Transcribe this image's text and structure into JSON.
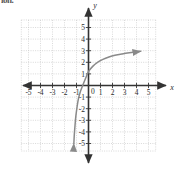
{
  "figure": {
    "corner_fragment": "ion.",
    "x_axis_name": "x",
    "y_axis_name": "y",
    "origin_label": "0"
  },
  "chart_data": {
    "type": "line",
    "title": "",
    "subtitle": "",
    "xlabel": "x",
    "ylabel": "y",
    "xlim": [
      -5.8,
      5.8
    ],
    "ylim": [
      -5.8,
      5.8
    ],
    "xticks": [
      -5,
      -4,
      -3,
      -2,
      -1,
      1,
      2,
      3,
      4,
      5
    ],
    "yticks": [
      -5,
      -4,
      -3,
      -2,
      -1,
      1,
      2,
      3,
      4,
      5
    ],
    "xtick_labels": [
      "-5",
      "-4",
      "-3",
      "-2",
      "-1",
      "1",
      "2",
      "3",
      "4",
      "5"
    ],
    "ytick_labels": [
      "-5",
      "-4",
      "-3",
      "-2",
      "-1",
      "1",
      "2",
      "3",
      "4",
      "5"
    ],
    "grid": true,
    "grid_style": "dotted",
    "grid_color": "#c8c8c8",
    "axis_color": "#333333",
    "legend": null,
    "legend_position": "none",
    "annotations": [],
    "series": [
      {
        "name": "curve",
        "color": "#8a8a8a",
        "arrow_start": true,
        "arrow_end": true,
        "description": "increasing concave-down curve with horizontal asymptote near y = 3 and vertical asymptote near x = -1.3",
        "asymptote_y": 3,
        "y_intercept": 1.2,
        "points": [
          [
            -1.22,
            -5.0
          ],
          [
            -1.18,
            -4.2
          ],
          [
            -1.12,
            -3.4
          ],
          [
            -1.05,
            -2.6
          ],
          [
            -0.96,
            -1.9
          ],
          [
            -0.85,
            -1.2
          ],
          [
            -0.7,
            -0.6
          ],
          [
            -0.5,
            -0.05
          ],
          [
            -0.25,
            0.6
          ],
          [
            0.0,
            1.2
          ],
          [
            0.35,
            1.65
          ],
          [
            0.75,
            2.0
          ],
          [
            1.2,
            2.25
          ],
          [
            1.7,
            2.45
          ],
          [
            2.2,
            2.6
          ],
          [
            2.8,
            2.72
          ],
          [
            3.4,
            2.82
          ],
          [
            4.0,
            2.9
          ],
          [
            4.35,
            2.95
          ]
        ]
      }
    ]
  }
}
